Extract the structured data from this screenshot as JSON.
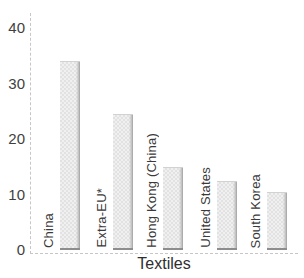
{
  "chart_data": {
    "type": "bar",
    "title": "",
    "xlabel": "Textiles",
    "ylabel": "",
    "categories": [
      "China",
      "Extra-EU*",
      "Hong Kong (China)",
      "United States",
      "South Korea"
    ],
    "values": [
      34,
      24.5,
      15,
      12.5,
      10.5
    ],
    "ylim": [
      0,
      40
    ],
    "yticks": [
      0,
      10,
      20,
      30,
      40
    ],
    "grid": false,
    "legend_position": "none",
    "bar_fill_color": "#eaeaea",
    "bar_texture": "dotted-weave",
    "bar_shadow_color": "#9b9b9b",
    "bar_bottom_edge_color": "#8d8d8d",
    "axis_line_style": "dashed",
    "axis_line_color": "#c6c6c6",
    "text_color": "#3a3a3a",
    "category_label_rotation_degrees": 90
  }
}
